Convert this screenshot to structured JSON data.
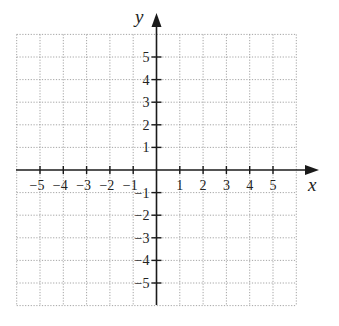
{
  "diagram": {
    "type": "cartesian-coordinate-grid",
    "x_axis": {
      "label": "x",
      "ticks": [
        -5,
        -4,
        -3,
        -2,
        -1,
        1,
        2,
        3,
        4,
        5
      ],
      "tick_labels": [
        "−5",
        "−4",
        "−3",
        "−2",
        "−1",
        "1",
        "2",
        "3",
        "4",
        "5"
      ],
      "grid_range": [
        -6,
        6
      ]
    },
    "y_axis": {
      "label": "y",
      "ticks": [
        5,
        4,
        3,
        2,
        1,
        -1,
        -2,
        -3,
        -4,
        -5
      ],
      "tick_labels": [
        "5",
        "4",
        "3",
        "2",
        "1",
        "−1",
        "−2",
        "−3",
        "−4",
        "−5"
      ],
      "grid_range": [
        -6,
        6
      ]
    },
    "grid": {
      "style": "dotted",
      "spacing": 1,
      "color": "#9a9a9a"
    },
    "axis_color": "#1a1a1a"
  }
}
